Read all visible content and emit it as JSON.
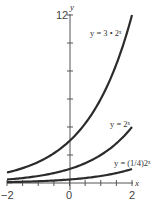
{
  "chart_data": {
    "type": "line",
    "title": "",
    "xlabel": "x",
    "ylabel": "y",
    "xlim": [
      -2,
      2
    ],
    "ylim": [
      0,
      12
    ],
    "x_tick_labels": [
      "-2",
      "0",
      "2"
    ],
    "y_tick_labels": [
      "12"
    ],
    "y_tick_step": 2,
    "x_tick_step": 0.5,
    "grid": false,
    "series": [
      {
        "name": "y = 3 • 2^x",
        "label": "y = 3 • 2ˣ",
        "x": [
          -2,
          -1,
          0,
          1,
          2
        ],
        "values": [
          0.75,
          1.5,
          3,
          6,
          12
        ]
      },
      {
        "name": "y = 2^x",
        "label": "y = 2ˣ",
        "x": [
          -2,
          -1,
          0,
          1,
          2
        ],
        "values": [
          0.25,
          0.5,
          1,
          2,
          4
        ]
      },
      {
        "name": "y = (1/4)2^x",
        "label": "y = (1/4)2ˣ",
        "x": [
          -2,
          -1,
          0,
          1,
          2
        ],
        "values": [
          0.0625,
          0.125,
          0.25,
          0.5,
          1
        ]
      }
    ]
  },
  "labels": {
    "x_axis": "x",
    "y_axis": "y",
    "xmin": "−2",
    "xzero": "0",
    "xmax": "2",
    "ymax": "12",
    "curve1": "y = 3 • 2ˣ",
    "curve2": "y = 2ˣ",
    "curve3": "y = (1/4)2ˣ"
  },
  "colors": {
    "curve": "#2b2b2b",
    "axis": "#555555"
  }
}
